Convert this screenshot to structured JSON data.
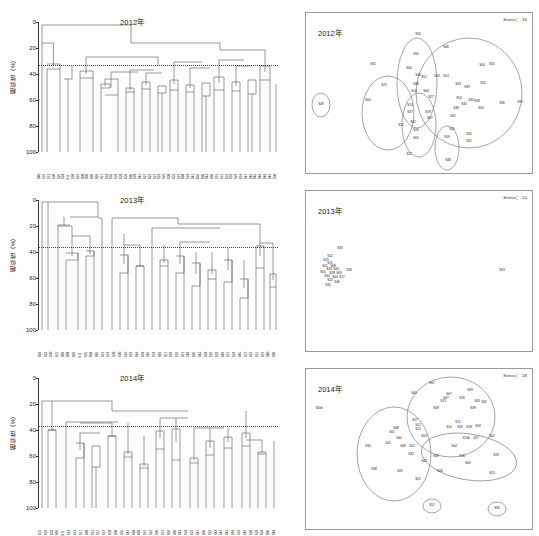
{
  "figure": {
    "panels": [
      {
        "year_label": "2012年",
        "dendrogram": {
          "ylabel": "相似性（%）",
          "yticks": [
            "0",
            "20",
            "40",
            "60",
            "80",
            "100"
          ],
          "ylim": [
            0,
            100
          ],
          "cutoff": 33,
          "leaves": [
            "S40",
            "S31",
            "S13",
            "S20",
            "S26",
            "S34",
            "S11",
            "S10",
            "S16",
            "S08",
            "S06",
            "S09",
            "S07",
            "S17",
            "S18",
            "S35",
            "S39",
            "S38",
            "S36",
            "S05",
            "S28",
            "S42",
            "S21",
            "S22",
            "S27",
            "S23",
            "S25",
            "S30",
            "S33",
            "S19",
            "S04",
            "S24",
            "S41",
            "S01",
            "S03",
            "S43",
            "S02",
            "S15",
            "S12",
            "S37",
            "S32",
            "S29",
            "S14",
            "S47",
            "S46",
            "S45",
            "S44",
            "S48",
            "S49",
            "S50"
          ]
        },
        "mds": {
          "stress_label": "Stress：.16",
          "points": [
            "S53",
            "S56",
            "S40",
            "S45",
            "S51",
            "S08",
            "S10",
            "S06",
            "S03",
            "S13",
            "S46",
            "S44",
            "S25",
            "S33",
            "S39",
            "S30",
            "S34",
            "S28",
            "S38",
            "S50",
            "S31",
            "S55",
            "S36",
            "S23",
            "S04",
            "S14",
            "S37",
            "S29",
            "S02",
            "S20",
            "S05",
            "S12",
            "S47",
            "S26",
            "S35",
            "S21",
            "S59",
            "S48",
            "S22",
            "S32",
            "S27",
            "S54",
            "S49",
            "S19"
          ]
        }
      },
      {
        "year_label": "2013年",
        "dendrogram": {
          "ylabel": "相似性（%）",
          "yticks": [
            "0",
            "20",
            "40",
            "60",
            "80",
            "100"
          ],
          "ylim": [
            0,
            100
          ],
          "cutoff": 36,
          "leaves": [
            "S02",
            "S23",
            "S30",
            "S31",
            "S09",
            "S08",
            "S07",
            "S11",
            "S35",
            "S04",
            "S05",
            "S13",
            "S14",
            "S38",
            "S20",
            "S25",
            "S29",
            "S44",
            "S34",
            "S46",
            "S18",
            "S02",
            "S17",
            "S39",
            "S36",
            "S12",
            "S48",
            "S01",
            "S43",
            "S28",
            "S26",
            "S33",
            "S49",
            "S21",
            "S24",
            "S45",
            "S37",
            "S52",
            "S15",
            "S19",
            "S40",
            "S06"
          ]
        },
        "mds": {
          "stress_label": "Stress：.14",
          "points": [
            "S33",
            "S22",
            "S15",
            "S11",
            "S01",
            "S08",
            "S43",
            "S44",
            "S05",
            "S28",
            "S09",
            "S30",
            "S04",
            "S17",
            "S24",
            "S46",
            "S35",
            "S36",
            "S23"
          ]
        }
      },
      {
        "year_label": "2014年",
        "dendrogram": {
          "ylabel": "相似性（%）",
          "yticks": [
            "0",
            "20",
            "40",
            "60",
            "80",
            "100"
          ],
          "ylim": [
            0,
            100
          ],
          "cutoff": 37,
          "leaves": [
            "S31",
            "S39",
            "S33",
            "S01",
            "S11",
            "S18",
            "S13",
            "S17",
            "S08",
            "S15",
            "S12",
            "S19",
            "S38",
            "S30",
            "S35",
            "S41",
            "S04",
            "S03",
            "S16",
            "S22",
            "S10",
            "S37",
            "S07",
            "S09",
            "S43",
            "S34",
            "S32",
            "S47",
            "S05",
            "S26",
            "S44",
            "S42",
            "S45",
            "S02",
            "S23",
            "S46",
            "S20",
            "S28",
            "S24",
            "S06",
            "S48"
          ]
        },
        "mds": {
          "stress_label": "Stress：.18",
          "points": [
            "S57",
            "S49",
            "S40",
            "S07",
            "S37",
            "S26",
            "S13",
            "S43",
            "S45",
            "S09",
            "S39",
            "S17",
            "S12",
            "S14",
            "S11",
            "S10",
            "S33",
            "S18",
            "S34",
            "S48",
            "S01",
            "S03",
            "S44",
            "S41",
            "S08",
            "S15",
            "S30",
            "S13b",
            "S27",
            "S02",
            "S04",
            "S38",
            "S32",
            "S46",
            "S40b",
            "S16",
            "S05",
            "S19",
            "S42",
            "S25",
            "S06",
            "S23",
            "S21",
            "S51",
            "S35"
          ]
        }
      }
    ]
  }
}
